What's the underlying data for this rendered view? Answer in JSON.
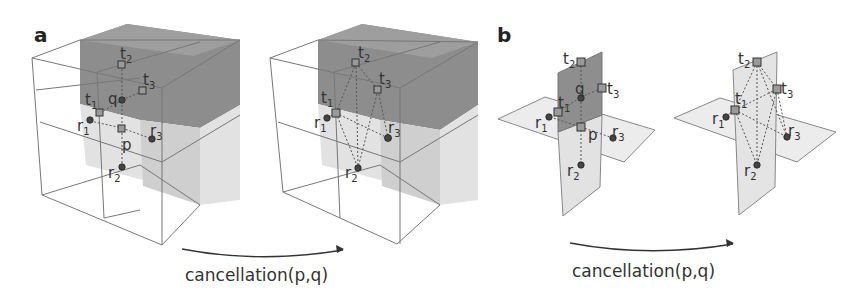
{
  "figure": {
    "panels": [
      {
        "letter": "a",
        "description": "2x2x2 cubical complex; dark gray upper-back cells, light gray lower cells",
        "before": {
          "labels": {
            "t1": "t",
            "t1_sub": "1",
            "t2": "t",
            "t2_sub": "2",
            "t3": "t",
            "t3_sub": "3",
            "q": "q",
            "p": "p",
            "r1": "r",
            "r1_sub": "1",
            "r2": "r",
            "r2_sub": "2",
            "r3": "r",
            "r3_sub": "3"
          }
        },
        "after": {
          "labels": {
            "t1": "t",
            "t1_sub": "1",
            "t2": "t",
            "t2_sub": "2",
            "t3": "t",
            "t3_sub": "3",
            "r1": "r",
            "r1_sub": "1",
            "r2": "r",
            "r2_sub": "2",
            "r3": "r",
            "r3_sub": "3"
          }
        },
        "arrow_label": "cancellation(p,q)"
      },
      {
        "letter": "b",
        "description": "Two intersecting planes: dark gray vertical upper plane, light gray horizontal and vertical lower planes",
        "before": {
          "labels": {
            "t1": "t",
            "t1_sub": "1",
            "t2": "t",
            "t2_sub": "2",
            "t3": "t",
            "t3_sub": "3",
            "q": "q",
            "p": "p",
            "r1": "r",
            "r1_sub": "1",
            "r2": "r",
            "r2_sub": "2",
            "r3": "r",
            "r3_sub": "3"
          }
        },
        "after": {
          "labels": {
            "t1": "t",
            "t1_sub": "1",
            "t2": "t",
            "t2_sub": "2",
            "t3": "t",
            "t3_sub": "3",
            "r1": "r",
            "r1_sub": "1",
            "r2": "r",
            "r2_sub": "2",
            "r3": "r",
            "r3_sub": "3"
          }
        },
        "arrow_label": "cancellation(p,q)"
      }
    ],
    "colors": {
      "dark_cell": "#8c8c8c",
      "light_cell": "#e0e0e0",
      "edge": "#777777",
      "point": "#444444"
    }
  }
}
